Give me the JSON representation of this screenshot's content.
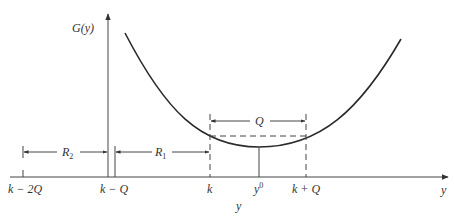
{
  "diagram": {
    "y_axis_label": "G(y)",
    "x_axis_label_end": "y",
    "x_axis_label_below": "y",
    "ticks": [
      {
        "id": "k-minus-2q",
        "label": "k − 2Q"
      },
      {
        "id": "k-minus-q",
        "label": "k − Q"
      },
      {
        "id": "k",
        "label": "k"
      },
      {
        "id": "y0",
        "label": "y",
        "superscript": "0"
      },
      {
        "id": "k-plus-q",
        "label": "k + Q"
      }
    ],
    "intervals": [
      {
        "id": "R2",
        "label": "R",
        "subscript": "2",
        "from": "k − 2Q",
        "to": "k − Q"
      },
      {
        "id": "R1",
        "label": "R",
        "subscript": "1",
        "from": "k − Q",
        "to": "k"
      },
      {
        "id": "Q",
        "label": "Q",
        "from": "k",
        "to": "k + Q"
      }
    ],
    "curve": {
      "description": "convex function G(y) with minimum at y0",
      "color": "#2a2a2a"
    },
    "colors": {
      "line": "#333333",
      "background": "#ffffff"
    }
  }
}
